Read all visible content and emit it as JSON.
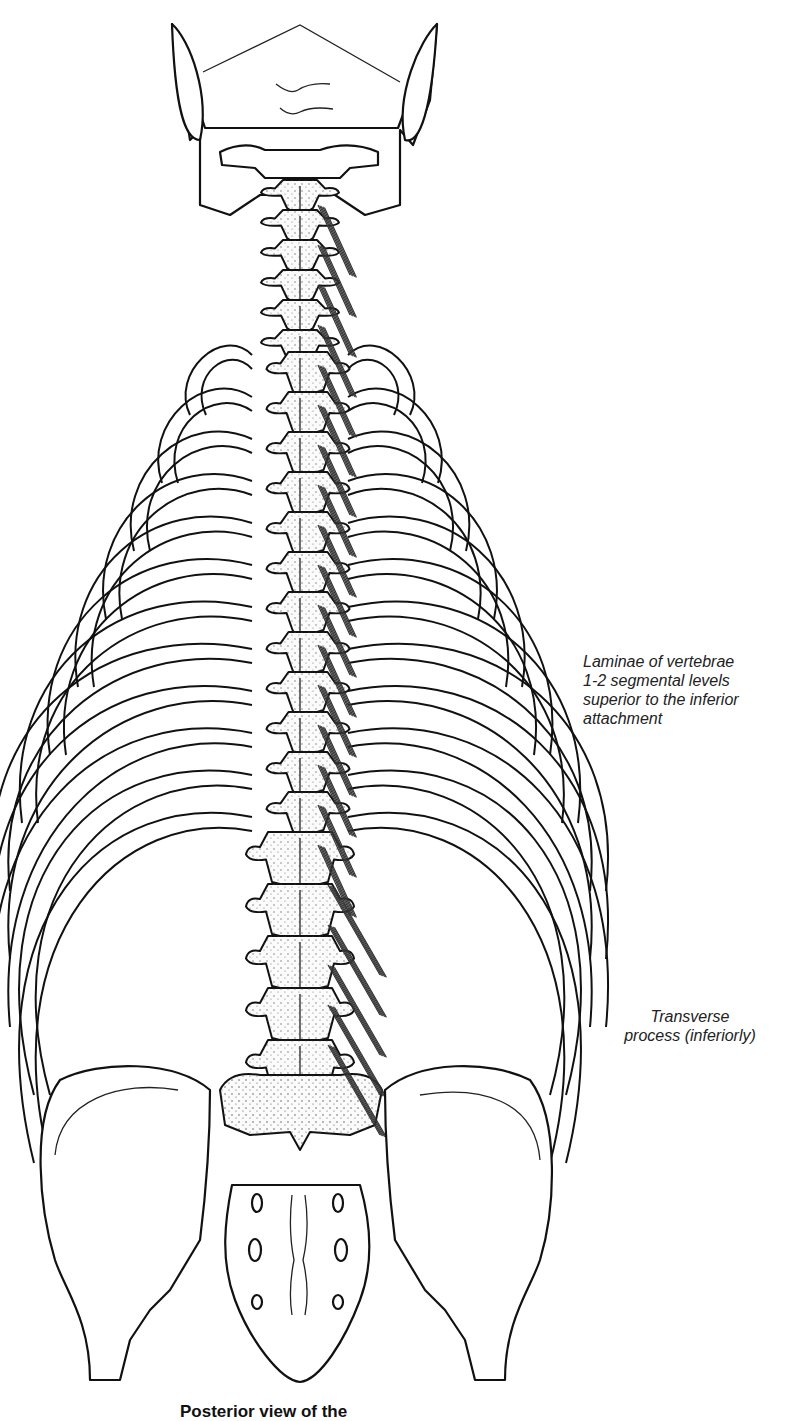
{
  "figure": {
    "labels": {
      "laminae": "Laminae of vertebrae\n1-2 segmental levels\nsuperior to the inferior\nattachment",
      "transverse": "Transverse\nprocess (inferiorly)"
    },
    "caption": "Posterior view of the"
  }
}
